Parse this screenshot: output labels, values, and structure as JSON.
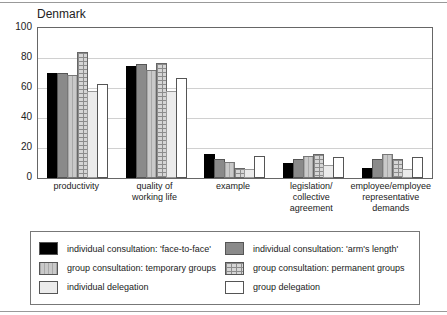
{
  "chart_data": {
    "type": "bar",
    "title": "Denmark",
    "xlabel": "",
    "ylabel": "",
    "ylim": [
      0,
      100
    ],
    "yticks": [
      100,
      80,
      60,
      40,
      20,
      0
    ],
    "grid": true,
    "legend_position": "bottom",
    "categories": [
      "productivity",
      "quality of working life",
      "example",
      "legislation/ collective agreement",
      "employee/employee representative demands"
    ],
    "category_label_lines": [
      [
        "productivity"
      ],
      [
        "quality of",
        "working life"
      ],
      [
        "example"
      ],
      [
        "legislation/",
        "collective agreement"
      ],
      [
        "employee/employee",
        "representative",
        "demands"
      ]
    ],
    "series": [
      {
        "name": "individual consultation: 'face-to-face'",
        "pattern": "black",
        "color": "#000000",
        "values": [
          70,
          75,
          16,
          10,
          7
        ]
      },
      {
        "name": "individual consultation: 'arm's length'",
        "pattern": "gray",
        "color": "#8a8a8a",
        "values": [
          70,
          76,
          13,
          13,
          13
        ]
      },
      {
        "name": "group consultation: temporary groups",
        "pattern": "dotted",
        "color": "#c9c9c9",
        "values": [
          69,
          72,
          11,
          15,
          16
        ]
      },
      {
        "name": "group consultation: permanent groups",
        "pattern": "grid",
        "color": "#d6d6d6",
        "values": [
          84,
          77,
          7,
          16,
          13
        ]
      },
      {
        "name": "individual delegation",
        "pattern": "faint",
        "color": "#ebebeb",
        "values": [
          58,
          58,
          6,
          9,
          6
        ]
      },
      {
        "name": "group delegation",
        "pattern": "white",
        "color": "#ffffff",
        "values": [
          63,
          67,
          15,
          14,
          14
        ]
      }
    ]
  },
  "axis": {
    "px_per_unit": 1.5
  }
}
